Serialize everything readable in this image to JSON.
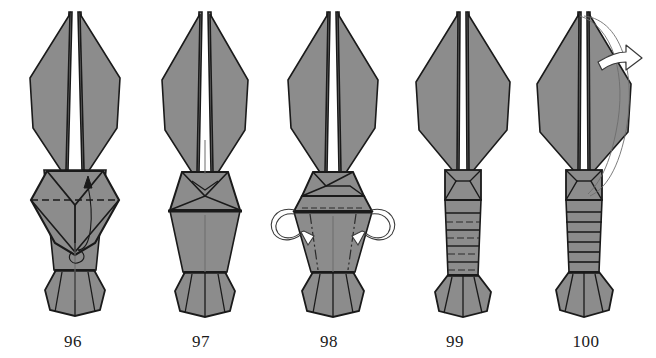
{
  "document": {
    "kind": "origami-folding-diagram",
    "subject": "lobster / shrimp origami step sequence",
    "background_color": "#ffffff",
    "paper_fill_color": "#8c8c8c",
    "line_color": "#1a1a1a",
    "crease_color": "#2b2b2b",
    "arrow_outline_color": "#3a3a3a",
    "step_count": 5
  },
  "steps": [
    {
      "id": "step-96",
      "caption": "96",
      "caption_x": 73,
      "center_x": 75,
      "description": "Head plate shown as a hexagon with a horizontal dashed valley-fold line and a small curved arrow folding the flap upward.",
      "creases": [
        "dashed-horizontal-valley-fold"
      ],
      "arrows": [
        "small-curved-up-arrow"
      ]
    },
    {
      "id": "step-97",
      "caption": "97",
      "caption_x": 201,
      "center_x": 205,
      "description": "Result of step 96: the head plate is now a flattened trapezoid with a heavy horizontal edge; body tapers to the tail.",
      "creases": [],
      "arrows": []
    },
    {
      "id": "step-98",
      "caption": "98",
      "caption_x": 329,
      "center_x": 333,
      "description": "Two hollow curved arrows at the sides of the head indicate folding the side flaps outward/back; dash-dot mountain lines run down the abdomen.",
      "creases": [
        "dash-dot-vertical-mountain-left",
        "dash-dot-vertical-mountain-right",
        "dashed-horizontal-under-head"
      ],
      "arrows": [
        "hollow-curved-arrow-left",
        "hollow-curved-arrow-right"
      ]
    },
    {
      "id": "step-99",
      "caption": "99",
      "caption_x": 455,
      "center_x": 459,
      "description": "Narrow body with a boxed head segment; a stack of alternating solid mountain and dashed valley lines marks the abdominal pleats to be formed.",
      "creases": [
        "horizontal-pleat-stack-alternating-mountain-valley"
      ],
      "arrows": []
    },
    {
      "id": "step-100",
      "caption": "100",
      "caption_x": 586,
      "center_x": 586,
      "description": "Pleats completed as solid segment lines; a large hollow curved arrow sweeping right over the top indicates turning the model over.",
      "creases": [
        "completed-horizontal-segment-lines"
      ],
      "arrows": [
        "large-hollow-turn-over-arrow"
      ]
    }
  ],
  "legend": {
    "dashed_line_meaning": "valley fold",
    "dash_dot_line_meaning": "mountain fold",
    "solid_line_meaning": "edge or completed crease",
    "hollow_arrow_meaning": "fold / turn direction"
  }
}
